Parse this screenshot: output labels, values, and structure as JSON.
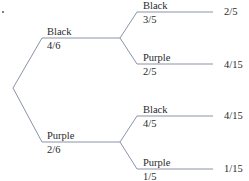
{
  "diagram": {
    "type": "probability-tree",
    "line_color": "#8a93a8",
    "first_stage": [
      {
        "outcome": "Black",
        "probability": "4/6"
      },
      {
        "outcome": "Purple",
        "probability": "2/6"
      }
    ],
    "second_stage": [
      {
        "outcome": "Black",
        "probability": "3/5",
        "result": "2/5"
      },
      {
        "outcome": "Purple",
        "probability": "2/5",
        "result": "4/15"
      },
      {
        "outcome": "Black",
        "probability": "4/5",
        "result": "4/15"
      },
      {
        "outcome": "Purple",
        "probability": "1/5",
        "result": "1/15"
      }
    ]
  }
}
